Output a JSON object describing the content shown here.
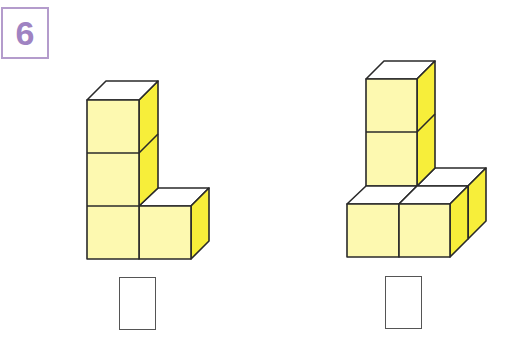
{
  "problem": {
    "number": "6",
    "accent_color": "#9f83c2"
  },
  "figures": [
    {
      "name": "figure-a",
      "cube_count": 4,
      "answer": ""
    },
    {
      "name": "figure-b",
      "cube_count": 6,
      "answer": ""
    }
  ],
  "colors": {
    "cube_front": "#fdf9b0",
    "cube_top": "#ffffff",
    "cube_side": "#f7ee3a",
    "outline": "#2a2a2a"
  }
}
